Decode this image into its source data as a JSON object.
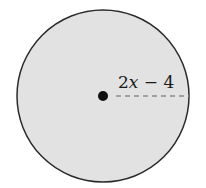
{
  "diagram": {
    "shape": "circle",
    "fill_color": "#e2e2e2",
    "stroke_color": "#2a2a2a",
    "center_point": "dot",
    "radius_line": "dashed",
    "radius_label": {
      "coefficient": "2",
      "variable": "x",
      "operator": " − ",
      "constant": "4",
      "full": "2x − 4"
    }
  }
}
